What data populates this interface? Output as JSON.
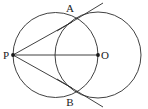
{
  "figure": {
    "kind": "geometry-diagram",
    "width": 148,
    "height": 109,
    "background_color": "#ffffff",
    "stroke_color": "#2b2b2b",
    "label_color": "#1a1a1a"
  },
  "points": [
    {
      "name": "P",
      "label": "P",
      "x": 13,
      "y": 55,
      "label_x": 6,
      "label_y": 59,
      "dot": true
    },
    {
      "name": "O",
      "label": "O",
      "x": 98,
      "y": 55,
      "label_x": 103,
      "label_y": 59,
      "dot": true
    },
    {
      "name": "A",
      "label": "A",
      "x": 72,
      "y": 22,
      "label_x": 68,
      "label_y": 12,
      "dot": false
    },
    {
      "name": "B",
      "label": "B",
      "x": 72,
      "y": 88,
      "label_x": 68,
      "label_y": 106,
      "dot": false
    }
  ],
  "circles": [
    {
      "name": "large-circle",
      "center_label": "O",
      "cx": 98,
      "cy": 55,
      "r": 43
    },
    {
      "name": "small-circle",
      "center_label": "midpoint-PO",
      "cx": 55.5,
      "cy": 55,
      "r": 42.5
    }
  ],
  "segments": [
    {
      "name": "segment-PA",
      "from": "P",
      "to": "A",
      "x1": 13,
      "y1": 55,
      "x2": 72,
      "y2": 22
    },
    {
      "name": "segment-PO",
      "from": "P",
      "to": "O",
      "x1": 13,
      "y1": 55,
      "x2": 98,
      "y2": 55
    },
    {
      "name": "segment-PB",
      "from": "P",
      "to": "B",
      "x1": 13,
      "y1": 55,
      "x2": 72,
      "y2": 88
    }
  ],
  "tangent_lines": [
    {
      "name": "tangent-at-A",
      "through": "A",
      "x1": 57,
      "y1": 31,
      "x2": 103,
      "y2": 3
    },
    {
      "name": "tangent-at-B",
      "through": "B",
      "x1": 57,
      "y1": 79,
      "x2": 103,
      "y2": 107
    }
  ],
  "stroke_widths": {
    "circle": 0.9,
    "segment": 0.9,
    "tangent": 0.9
  },
  "dot_radius": 1.9
}
